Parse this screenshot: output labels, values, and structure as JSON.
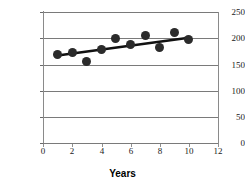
{
  "chart_data": {
    "type": "scatter",
    "title": "",
    "subtitle": "",
    "xlabel": "Years",
    "ylabel": "",
    "xlim": [
      0,
      12
    ],
    "ylim": [
      0,
      250
    ],
    "grid": "horizontal",
    "legend": "none",
    "x_ticks": [
      0,
      2,
      4,
      6,
      8,
      10,
      12
    ],
    "y_ticks": [
      0,
      50,
      100,
      150,
      200,
      250
    ],
    "x_tick_labels": [
      "0",
      "2",
      "4",
      "6",
      "8",
      "10",
      "12"
    ],
    "y_tick_labels": [
      "0",
      "50",
      "100",
      "150",
      "200",
      "250"
    ],
    "x": [
      1,
      2,
      3,
      4,
      5,
      6,
      7,
      8,
      9,
      10
    ],
    "values": [
      168,
      173,
      155,
      178,
      200,
      188,
      205,
      183,
      211,
      198
    ],
    "series": [
      {
        "name": "data",
        "type": "scatter",
        "marker": "filled-circle",
        "color": "#2b2b2b",
        "points": [
          {
            "x": 1,
            "y": 168
          },
          {
            "x": 2,
            "y": 173
          },
          {
            "x": 3,
            "y": 155
          },
          {
            "x": 4,
            "y": 178
          },
          {
            "x": 5,
            "y": 200
          },
          {
            "x": 6,
            "y": 188
          },
          {
            "x": 7,
            "y": 205
          },
          {
            "x": 8,
            "y": 183
          },
          {
            "x": 9,
            "y": 211
          },
          {
            "x": 10,
            "y": 198
          }
        ]
      },
      {
        "name": "trendline",
        "type": "line",
        "color": "#111111",
        "points": [
          {
            "x": 1,
            "y": 167
          },
          {
            "x": 10,
            "y": 201
          }
        ]
      }
    ],
    "colors": {
      "marker": "#2b2b2b",
      "trendline": "#111111",
      "gridline": "#7a7a7a",
      "axis": "#8a8a8a",
      "background": "#ffffff",
      "text": "#1a1a1a"
    }
  }
}
